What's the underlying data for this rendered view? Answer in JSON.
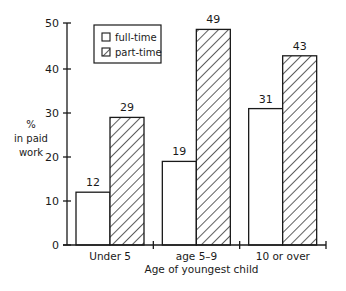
{
  "chart_data": {
    "type": "bar",
    "title": "",
    "xlabel": "Age of youngest child",
    "ylabel": "% in paid work",
    "ylabel_lines": [
      "%",
      "in paid",
      "work"
    ],
    "ylim": [
      0,
      50
    ],
    "yticks": [
      0,
      10,
      20,
      30,
      40,
      50
    ],
    "categories": [
      "Under 5",
      "age 5–9",
      "10 or over"
    ],
    "series": [
      {
        "name": "full-time",
        "pattern": "hollow",
        "values": [
          12,
          19,
          31
        ]
      },
      {
        "name": "part-time",
        "pattern": "diagonal-hatch",
        "values": [
          29,
          49,
          43
        ]
      }
    ],
    "data_labels": true,
    "grid": false,
    "legend": {
      "position": "top-left inside",
      "entries": [
        "full-time",
        "part-time"
      ]
    }
  },
  "colors": {
    "ink": "#1a1a1a",
    "background": "#ffffff"
  }
}
